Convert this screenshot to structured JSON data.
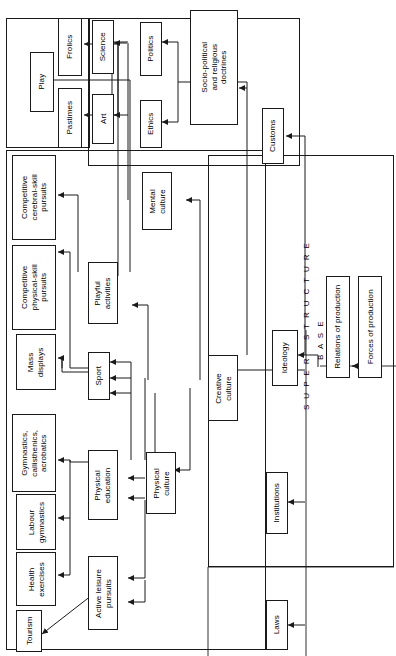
{
  "diagram": {
    "orientation": "rotated-90",
    "band_labels": [
      {
        "id": "superstructure",
        "text": "S U P E R    S T R U C T U R E"
      },
      {
        "id": "base",
        "text": "B A S E"
      }
    ],
    "nodes": [
      {
        "id": "play",
        "label": "Play"
      },
      {
        "id": "frolics",
        "label": "Frolics"
      },
      {
        "id": "pastimes",
        "label": "Pastimes"
      },
      {
        "id": "science",
        "label": "Science"
      },
      {
        "id": "art",
        "label": "Art"
      },
      {
        "id": "politics",
        "label": "Politics"
      },
      {
        "id": "ethics",
        "label": "Ethics"
      },
      {
        "id": "socio_political",
        "label": "Socio-political\nand religious\ndoctrines"
      },
      {
        "id": "customs",
        "label": "Customs"
      },
      {
        "id": "competitive_cerebral",
        "label": "Competitive\ncerebral-skill\npursuits"
      },
      {
        "id": "competitive_physical",
        "label": "Competitive\nphysical-skill\npursuits"
      },
      {
        "id": "mass_displays",
        "label": "Mass\ndisplays"
      },
      {
        "id": "gymnastics",
        "label": "Gymnastics,\ncallisthenics,\nacrobatics"
      },
      {
        "id": "labour_gymnastics",
        "label": "Labour\ngymnastics"
      },
      {
        "id": "health_exercises",
        "label": "Health\nexercises"
      },
      {
        "id": "tourism",
        "label": "Tourism"
      },
      {
        "id": "mental_culture",
        "label": "Mental\nculture"
      },
      {
        "id": "playful_activities",
        "label": "Playful\nactivities"
      },
      {
        "id": "sport",
        "label": "Sport"
      },
      {
        "id": "physical_education",
        "label": "Physical\neducation"
      },
      {
        "id": "active_leisure",
        "label": "Active leisure\npursuits"
      },
      {
        "id": "physical_culture",
        "label": "Physical\nculture"
      },
      {
        "id": "creative_culture",
        "label": "Creative\nculture"
      },
      {
        "id": "ideology",
        "label": "Ideology"
      },
      {
        "id": "institutions",
        "label": "Institutions"
      },
      {
        "id": "laws",
        "label": "Laws"
      },
      {
        "id": "relations_production",
        "label": "Relations of production"
      },
      {
        "id": "forces_production",
        "label": "Forces of production"
      }
    ],
    "edges": [
      {
        "from": "playful_activities",
        "to": "frolics"
      },
      {
        "from": "playful_activities",
        "to": "pastimes"
      },
      {
        "from": "playful_activities",
        "to": "play"
      },
      {
        "from": "mental_culture",
        "to": "science"
      },
      {
        "from": "mental_culture",
        "to": "art"
      },
      {
        "from": "ideology",
        "to": "politics"
      },
      {
        "from": "ideology",
        "to": "ethics"
      },
      {
        "from": "ideology",
        "to": "socio_political"
      },
      {
        "from": "ideology",
        "to": "customs"
      },
      {
        "from": "ideology",
        "to": "institutions"
      },
      {
        "from": "ideology",
        "to": "laws"
      },
      {
        "from": "playful_activities",
        "to": "competitive_cerebral"
      },
      {
        "from": "sport",
        "to": "competitive_physical"
      },
      {
        "from": "sport",
        "to": "mass_displays"
      },
      {
        "from": "physical_education",
        "to": "gymnastics"
      },
      {
        "from": "physical_education",
        "to": "labour_gymnastics"
      },
      {
        "from": "active_leisure",
        "to": "health_exercises"
      },
      {
        "from": "active_leisure",
        "to": "tourism"
      },
      {
        "from": "creative_culture",
        "to": "mental_culture"
      },
      {
        "from": "creative_culture",
        "to": "playful_activities"
      },
      {
        "from": "physical_culture",
        "to": "sport"
      },
      {
        "from": "physical_culture",
        "to": "physical_education"
      },
      {
        "from": "physical_culture",
        "to": "active_leisure"
      },
      {
        "from": "creative_culture",
        "to": "physical_culture"
      },
      {
        "from": "base",
        "to": "creative_culture"
      },
      {
        "from": "base",
        "to": "ideology"
      },
      {
        "from": "forces_production",
        "to": "relations_production"
      }
    ],
    "groups": [
      {
        "id": "play-group",
        "label": ""
      },
      {
        "id": "culture-group",
        "label": ""
      },
      {
        "id": "pc-group",
        "label": ""
      }
    ],
    "colors": {
      "stroke": "#1a1a1a",
      "background": "#ffffff",
      "text": "#000000"
    }
  }
}
